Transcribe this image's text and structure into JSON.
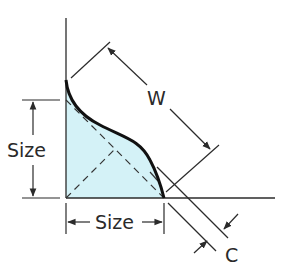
{
  "diagram": {
    "type": "convex fillet weld cross-section",
    "labels": {
      "size_left": "Size",
      "size_bottom": "Size",
      "width": "W",
      "convexity": "C"
    },
    "colors": {
      "line": "#2b2b2b",
      "weld_face": "#111111",
      "fill": "#d4f2f7",
      "dashed": "#333333",
      "background": "#ffffff"
    }
  }
}
